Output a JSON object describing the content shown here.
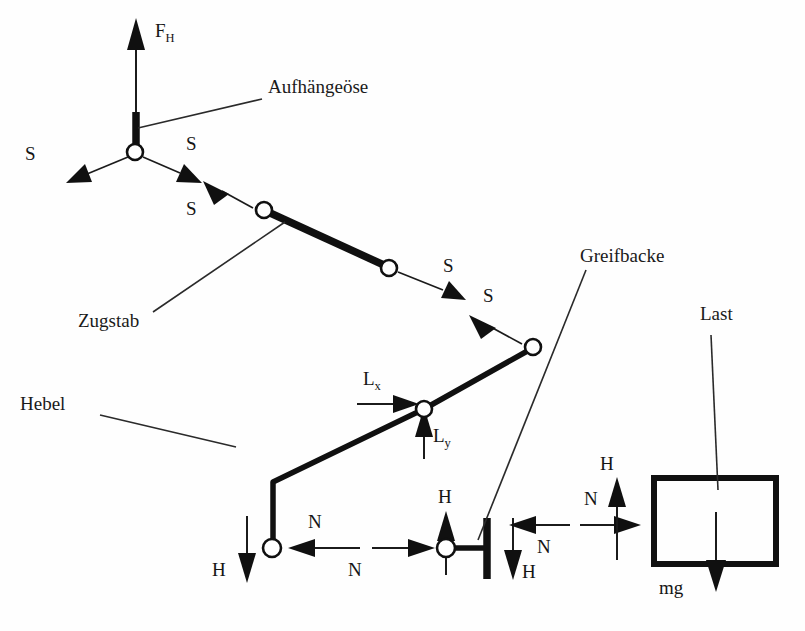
{
  "figure": {
    "background_color": "#fefefe",
    "ink_color": "#101010"
  },
  "part_labels": {
    "suspension_eye": "Aufhängeöse",
    "tie_rod": "Zugstab",
    "lever": "Hebel",
    "gripper_jaw": "Greifbacke",
    "load": "Last"
  },
  "force_labels": {
    "hoist_force": "F",
    "hoist_force_subscript": "H",
    "rod_force_1": "S",
    "rod_force_2": "S",
    "rod_force_3": "S",
    "rod_force_4": "S",
    "rod_force_5": "S",
    "rod_force_6": "S",
    "bearing_x": "L",
    "bearing_x_subscript": "x",
    "bearing_y": "L",
    "bearing_y_subscript": "y",
    "normal_1": "N",
    "normal_2": "N",
    "normal_3": "N",
    "normal_4": "N",
    "friction_1": "H",
    "friction_2": "H",
    "friction_3": "H",
    "friction_4": "H",
    "weight": "mg"
  },
  "geometry": {
    "eye_node": [
      135,
      152
    ],
    "chain_joint_2": [
      264,
      210
    ],
    "chain_joint_3": [
      389,
      268
    ],
    "chain_joint_4": [
      533,
      347
    ],
    "lever_pivot": [
      424,
      409
    ],
    "lever_elbow": [
      273,
      482
    ],
    "lever_bottom_node": [
      272,
      548
    ],
    "jaw_node": [
      446,
      548
    ],
    "jaw_bar_x": 487,
    "load_block": [
      654,
      478,
      776,
      564
    ]
  }
}
